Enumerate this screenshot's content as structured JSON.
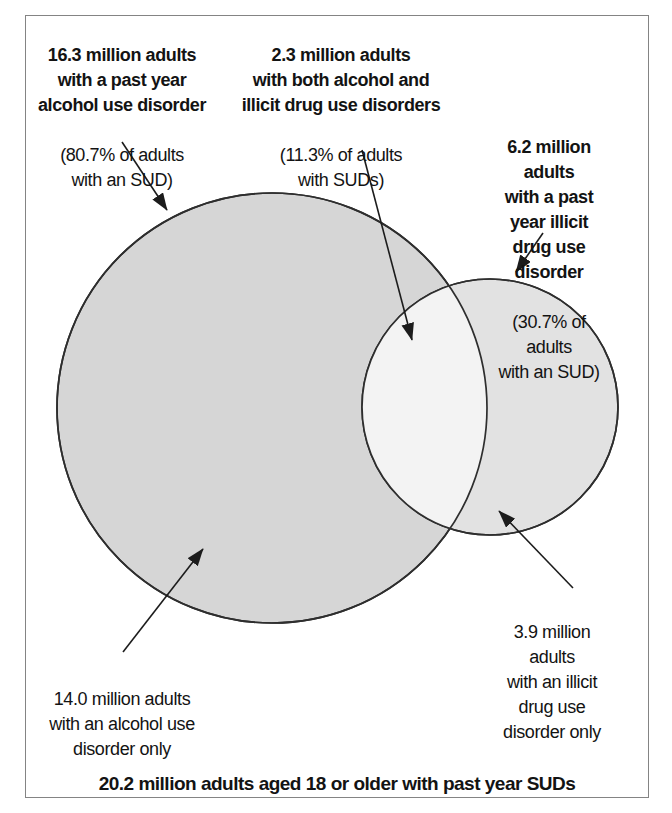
{
  "figure": {
    "type": "venn",
    "caption": "20.2 million adults aged 18 or older with past year SUDs",
    "total_adults_with_suds_millions": 20.2,
    "sets": [
      {
        "name": "past year alcohol use disorder",
        "value_millions": 16.3,
        "percent_of_adults_with_sud": "80.7%",
        "only_value_millions": 14.0
      },
      {
        "name": "past year illicit drug use disorder",
        "value_millions": 6.2,
        "percent_of_adults_with_sud": "30.7%",
        "only_value_millions": 3.9
      }
    ],
    "overlap": {
      "name": "both alcohol and illicit drug use disorders",
      "value_millions": 2.3,
      "percent_of_adults_with_sud": "11.3%"
    }
  },
  "labels": {
    "alcohol_total": {
      "main": "16.3 million adults\nwith a past year\nalcohol use disorder",
      "sub": "(80.7% of adults\nwith an SUD)"
    },
    "both": {
      "main": "2.3 million adults\nwith both alcohol and\nillicit drug use disorders",
      "sub": "(11.3% of adults\nwith SUDs)"
    },
    "drug_total": {
      "main": "6.2 million adults\nwith a past year illicit\ndrug use disorder",
      "sub": "(30.7% of adults\nwith an SUD)"
    },
    "drug_only": {
      "main": "3.9 million adults\nwith an illicit drug use\ndisorder only"
    },
    "alcohol_only": {
      "main": "14.0 million adults\nwith an alcohol use\ndisorder only"
    }
  },
  "colors": {
    "alcohol_fill": "#d6d6d6",
    "drug_fill": "#e2e2e2",
    "overlap_fill": "#f3f3f3",
    "circle_stroke": "#2e2e2e",
    "arrow_color": "#1c1c1c",
    "frame_border": "#848484",
    "text": "#131313"
  }
}
